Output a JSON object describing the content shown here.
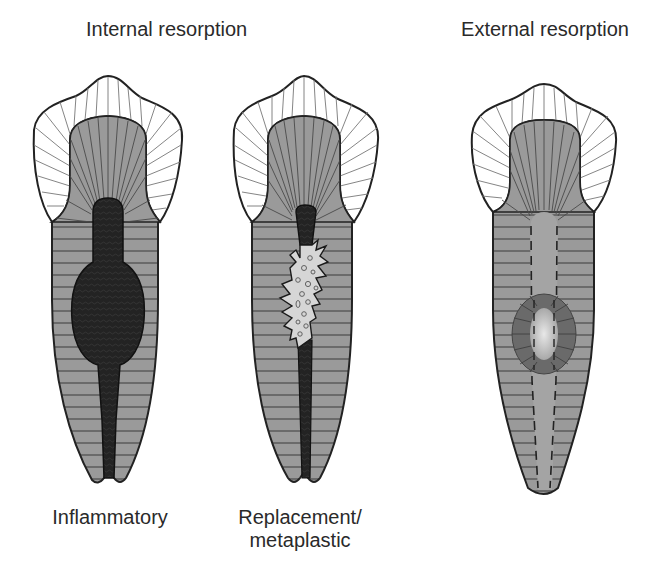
{
  "titles": {
    "internal": "Internal resorption",
    "external": "External resorption"
  },
  "captions": {
    "inflammatory": "Inflammatory",
    "replacement_line1": "Replacement/",
    "replacement_line2": "metaplastic"
  },
  "teeth": [
    {
      "id": "inflammatory",
      "group": "Internal resorption",
      "lesion": "dark oval canal enlargement"
    },
    {
      "id": "replacement",
      "group": "Internal resorption",
      "lesion": "light irregular jagged area with small circles"
    },
    {
      "id": "external",
      "group": "External resorption",
      "lesion": "ring-shaped defect on root surface over canal"
    }
  ],
  "colors": {
    "enamel": "#ffffff",
    "dentin": "#9a9a9a",
    "pulp_dark": "#262626",
    "replacement_tissue": "#d6d6d6",
    "outline": "#222222",
    "external_ring": "#6a6a6a",
    "external_center": "#d0d0d0"
  }
}
